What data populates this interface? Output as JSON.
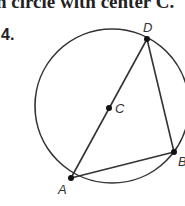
{
  "header": {
    "text": "n circle with center C."
  },
  "problem": {
    "number": "4."
  },
  "diagram": {
    "circle": {
      "cx": 112,
      "cy": 106,
      "r": 77
    },
    "points": {
      "A": {
        "label": "A",
        "x": 71,
        "y": 178
      },
      "B": {
        "label": "B",
        "x": 174,
        "y": 152
      },
      "C": {
        "label": "C",
        "x": 109,
        "y": 108
      },
      "D": {
        "label": "D",
        "x": 147,
        "y": 39
      }
    },
    "segments": [
      "AD",
      "DB",
      "AB"
    ],
    "stroke_color": "#333333"
  }
}
